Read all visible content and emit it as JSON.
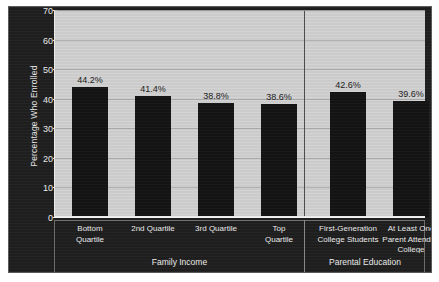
{
  "chart_data": {
    "type": "bar",
    "title": "",
    "xlabel": "",
    "ylabel": "Percentage Who Enrolled",
    "ylim": [
      0,
      70
    ],
    "yticks": [
      0,
      10,
      20,
      30,
      40,
      50,
      60,
      70
    ],
    "grid": true,
    "legend": false,
    "categories": [
      "Bottom Quartile",
      "2nd Quartile",
      "3rd Quartile",
      "Top Quartile",
      "First-Generation College Students",
      "At Least One Parent Attended College"
    ],
    "category_lines": [
      [
        "Bottom",
        "Quartile"
      ],
      [
        "2nd Quartile"
      ],
      [
        "3rd Quartile"
      ],
      [
        "Top",
        "Quartile"
      ],
      [
        "First-Generation",
        "College Students"
      ],
      [
        "At Least One",
        "Parent Attended",
        "College"
      ]
    ],
    "values": [
      44.2,
      41.4,
      38.8,
      38.6,
      42.6,
      39.6
    ],
    "value_labels": [
      "44.2%",
      "41.4%",
      "38.8%",
      "38.6%",
      "42.6%",
      "39.6%"
    ],
    "groups": [
      {
        "label": "Family Income",
        "categories": [
          0,
          1,
          2,
          3
        ]
      },
      {
        "label": "Parental Education",
        "categories": [
          4,
          5
        ]
      }
    ],
    "bar_color": "#141414",
    "plot_background": "#d2d2d2",
    "panel_background": "#1f1f1f",
    "text_color": "#ededed"
  }
}
